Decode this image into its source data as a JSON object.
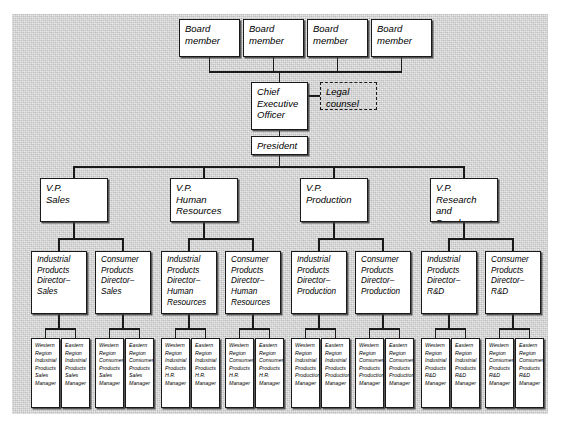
{
  "diagram": {
    "type": "org-chart",
    "levels": 5,
    "colors": {
      "box_fill": "#ffffff",
      "line": "#1a1a1a",
      "background": "#d4d4d4"
    },
    "board": [
      {
        "id": "bm1",
        "label": "Board\nmember"
      },
      {
        "id": "bm2",
        "label": "Board\nmember"
      },
      {
        "id": "bm3",
        "label": "Board\nmember"
      },
      {
        "id": "bm4",
        "label": "Board\nmember"
      }
    ],
    "ceo": {
      "id": "ceo",
      "label": "Chief\nExecutive\nOfficer"
    },
    "legal": {
      "id": "legal",
      "label": "Legal\ncounsel",
      "style": "dashed"
    },
    "president": {
      "id": "pres",
      "label": "President"
    },
    "vps": [
      {
        "id": "vp-sales",
        "label": "V.P.\nSales"
      },
      {
        "id": "vp-hr",
        "label": "V.P.\nHuman\nResources"
      },
      {
        "id": "vp-prod",
        "label": "V.P.\nProduction"
      },
      {
        "id": "vp-rd",
        "label": "V.P.\nResearch and\nDevelopment"
      }
    ],
    "directors": [
      {
        "id": "dir-ind-sales",
        "label": "Industrial\nProducts\nDirector–\nSales"
      },
      {
        "id": "dir-con-sales",
        "label": "Consumer\nProducts\nDirector–\nSales"
      },
      {
        "id": "dir-ind-hr",
        "label": "Industrial\nProducts\nDirector–\nHuman\nResources"
      },
      {
        "id": "dir-con-hr",
        "label": "Consumer\nProducts\nDirector–\nHuman\nResources"
      },
      {
        "id": "dir-ind-prod",
        "label": "Industrial\nProducts\nDirector–\nProduction"
      },
      {
        "id": "dir-con-prod",
        "label": "Consumer\nProducts\nDirector–\nProduction"
      },
      {
        "id": "dir-ind-rd",
        "label": "Industrial\nProducts\nDirector–\nR&D"
      },
      {
        "id": "dir-con-rd",
        "label": "Consumer\nProducts\nDirector–\nR&D"
      }
    ],
    "managers": [
      {
        "id": "mgr-1",
        "label": "Western\nRegion\nIndustrial\nProducts\nSales\nManager"
      },
      {
        "id": "mgr-2",
        "label": "Eastern\nRegion\nIndustrial\nProducts\nSales\nManager"
      },
      {
        "id": "mgr-3",
        "label": "Western\nRegion\nConsumer\nProducts\nSales\nManager"
      },
      {
        "id": "mgr-4",
        "label": "Eastern\nRegion\nConsumer\nProducts\nSales\nManager"
      },
      {
        "id": "mgr-5",
        "label": "Western\nRegion\nIndustrial\nProducts\nH.R.\nManager"
      },
      {
        "id": "mgr-6",
        "label": "Eastern\nRegion\nIndustrial\nProducts\nH.R.\nManager"
      },
      {
        "id": "mgr-7",
        "label": "Western\nRegion\nConsumer\nProducts\nH.R.\nManager"
      },
      {
        "id": "mgr-8",
        "label": "Eastern\nRegion\nConsumer\nProducts\nH.R.\nManager"
      },
      {
        "id": "mgr-9",
        "label": "Western\nRegion\nIndustrial\nProducts\nProduction\nManager"
      },
      {
        "id": "mgr-10",
        "label": "Eastern\nRegion\nIndustrial\nProducts\nProduction\nManager"
      },
      {
        "id": "mgr-11",
        "label": "Western\nRegion\nConsumer\nProducts\nProduction\nManager"
      },
      {
        "id": "mgr-12",
        "label": "Eastern\nRegion\nConsumer\nProducts\nProduction\nManager"
      },
      {
        "id": "mgr-13",
        "label": "Western\nRegion\nIndustrial\nProducts\nR&D\nManager"
      },
      {
        "id": "mgr-14",
        "label": "Eastern\nRegion\nIndustrial\nProducts\nR&D\nManager"
      },
      {
        "id": "mgr-15",
        "label": "Western\nRegion\nConsumer\nProducts\nR&D\nManager"
      },
      {
        "id": "mgr-16",
        "label": "Eastern\nRegion\nConsumer\nProducts\nR&D\nManager"
      }
    ]
  }
}
